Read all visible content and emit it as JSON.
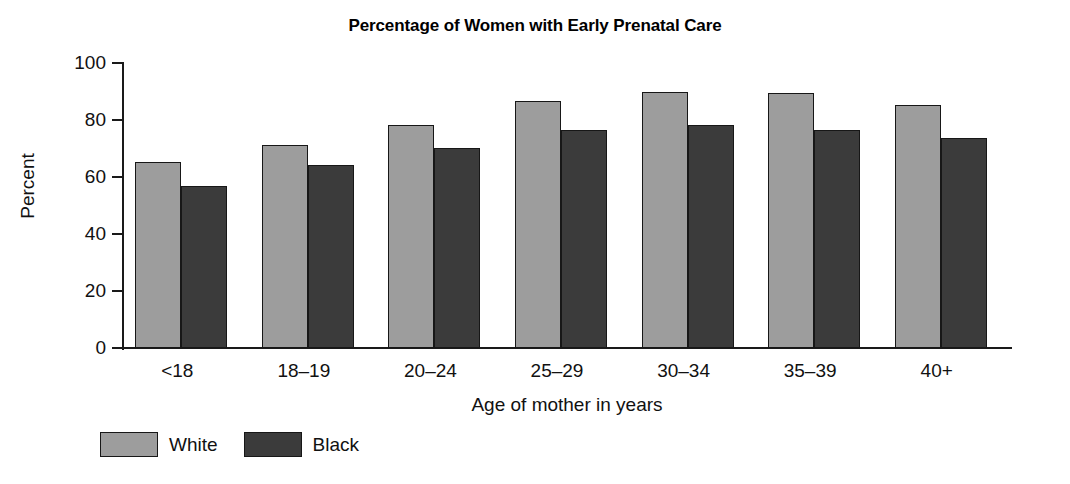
{
  "chart_data": {
    "type": "bar",
    "title": "Percentage of Women with Early Prenatal Care",
    "xlabel": "Age of mother in years",
    "ylabel": "Percent",
    "ylim": [
      0,
      100
    ],
    "yticks": [
      0,
      20,
      40,
      60,
      80,
      100
    ],
    "ytick_labels": [
      "0",
      "20",
      "40",
      "60",
      "80",
      "100"
    ],
    "grid": false,
    "legend_position": "bottom-left",
    "categories": [
      "<18",
      "18–19",
      "20–24",
      "25–29",
      "30–34",
      "35–39",
      "40+"
    ],
    "series": [
      {
        "name": "White",
        "color": "#9d9d9d",
        "values": [
          65.3,
          71.3,
          78.3,
          86.7,
          89.7,
          89.5,
          85.3
        ]
      },
      {
        "name": "Black",
        "color": "#3b3b3b",
        "values": [
          56.7,
          64.3,
          70.3,
          76.5,
          78.2,
          76.6,
          73.8
        ]
      }
    ]
  }
}
